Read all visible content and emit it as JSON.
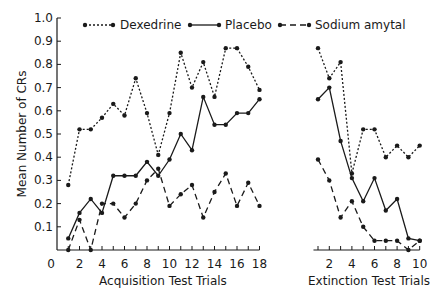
{
  "chart_data": [
    {
      "type": "line",
      "title": "",
      "xlabel": "Acquisition Test Trials",
      "ylabel": "Mean Number of CRs",
      "ylim": [
        0,
        1.0
      ],
      "xlim": [
        0,
        18
      ],
      "yticks": [
        "0.1",
        "0.2",
        "0.3",
        "0.4",
        "0.5",
        "0.6",
        "0.7",
        "0.8",
        "0.9",
        "1.0"
      ],
      "xticks": [
        "0",
        "2",
        "4",
        "6",
        "8",
        "10",
        "12",
        "14",
        "16",
        "18"
      ],
      "x": [
        1,
        2,
        3,
        4,
        5,
        6,
        7,
        8,
        9,
        10,
        11,
        12,
        13,
        14,
        15,
        16,
        17,
        18
      ],
      "series": [
        {
          "name": "Dexedrine",
          "style": "dotted",
          "values": [
            0.28,
            0.52,
            0.52,
            0.57,
            0.63,
            0.58,
            0.74,
            0.59,
            0.41,
            0.59,
            0.85,
            0.7,
            0.81,
            0.66,
            0.87,
            0.87,
            0.79,
            0.69
          ]
        },
        {
          "name": "Placebo",
          "style": "solid",
          "values": [
            0.05,
            0.16,
            0.22,
            0.16,
            0.32,
            0.32,
            0.32,
            0.38,
            0.32,
            0.39,
            0.5,
            0.43,
            0.66,
            0.54,
            0.54,
            0.59,
            0.59,
            0.65
          ]
        },
        {
          "name": "Sodium amytal",
          "style": "dashed",
          "values": [
            0.0,
            0.13,
            0.0,
            0.2,
            0.2,
            0.14,
            0.2,
            0.3,
            0.35,
            0.19,
            0.24,
            0.28,
            0.14,
            0.25,
            0.33,
            0.19,
            0.29,
            0.19
          ]
        }
      ],
      "grid": false,
      "legend_position": "top"
    },
    {
      "type": "line",
      "title": "",
      "xlabel": "Extinction Test Trials",
      "ylabel": "",
      "ylim": [
        0,
        1.0
      ],
      "xlim": [
        1,
        10
      ],
      "xticks": [
        "2",
        "4",
        "6",
        "8",
        "10"
      ],
      "x": [
        1,
        2,
        3,
        4,
        5,
        6,
        7,
        8,
        9,
        10
      ],
      "series": [
        {
          "name": "Dexedrine",
          "style": "dotted",
          "values": [
            0.87,
            0.74,
            0.81,
            0.33,
            0.52,
            0.52,
            0.4,
            0.45,
            0.4,
            0.45
          ]
        },
        {
          "name": "Placebo",
          "style": "solid",
          "values": [
            0.65,
            0.7,
            0.47,
            0.31,
            0.21,
            0.31,
            0.17,
            0.22,
            0.05,
            0.04
          ]
        },
        {
          "name": "Sodium amytal",
          "style": "dashed",
          "values": [
            0.39,
            0.3,
            0.14,
            0.21,
            0.1,
            0.04,
            0.04,
            0.04,
            0.0,
            0.04
          ]
        }
      ],
      "grid": false
    }
  ],
  "legend": [
    {
      "label": "Dexedrine",
      "style": "dotted"
    },
    {
      "label": "Placebo",
      "style": "solid"
    },
    {
      "label": "Sodium amytal",
      "style": "dashed"
    }
  ],
  "axes": {
    "ylabel": "Mean Number of CRs",
    "acq_xlabel": "Acquisition Test Trials",
    "ext_xlabel": "Extinction Test Trials",
    "origin_label": "0"
  }
}
